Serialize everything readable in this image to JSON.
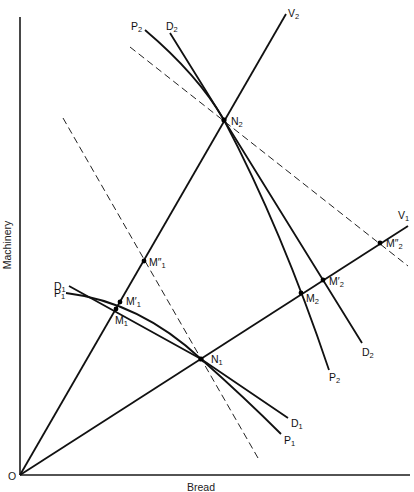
{
  "diagram": {
    "x_axis_label": "Bread",
    "y_axis_label": "Machinery",
    "origin_label": "O",
    "rays": [
      {
        "name": "V1",
        "main": "V",
        "sub": "1"
      },
      {
        "name": "V2",
        "main": "V",
        "sub": "2"
      }
    ],
    "curves": [
      {
        "name": "P1",
        "main": "P",
        "sub": "1"
      },
      {
        "name": "D1",
        "main": "D",
        "sub": "1"
      },
      {
        "name": "P2",
        "main": "P",
        "sub": "2"
      },
      {
        "name": "D2",
        "main": "D",
        "sub": "2"
      }
    ],
    "points": [
      {
        "name": "N1",
        "main": "N",
        "sub": "1"
      },
      {
        "name": "N2",
        "main": "N",
        "sub": "2"
      },
      {
        "name": "M1",
        "main": "M",
        "sub": "1"
      },
      {
        "name": "M1'",
        "main": "M′",
        "sub": "1"
      },
      {
        "name": "M1''",
        "main": "M″",
        "sub": "1"
      },
      {
        "name": "M2",
        "main": "M",
        "sub": "2"
      },
      {
        "name": "M2'",
        "main": "M′",
        "sub": "2"
      },
      {
        "name": "M2''",
        "main": "M″",
        "sub": "2"
      }
    ]
  }
}
